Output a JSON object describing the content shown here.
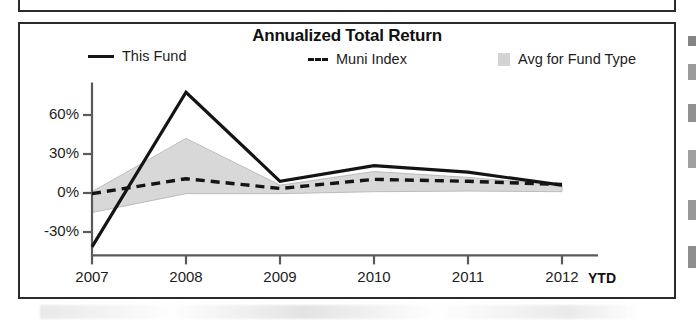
{
  "chart_data": {
    "type": "line",
    "title": "Annualized Total Return",
    "xlabel": "YTD",
    "ylabel": "",
    "categories": [
      "2007",
      "2008",
      "2009",
      "2010",
      "2011",
      "2012"
    ],
    "x_tick_labels": [
      "2007",
      "2008",
      "2009",
      "2010",
      "2011",
      "2012"
    ],
    "y_tick_labels": [
      "60%",
      "30%",
      "0%",
      "-30%"
    ],
    "y_ticks": [
      60,
      30,
      0,
      -30
    ],
    "ylim": [
      -48,
      85
    ],
    "grid": false,
    "legend_position": "top",
    "series": [
      {
        "name": "This Fund",
        "style": "solid-line",
        "values": [
          -41.5,
          77.5,
          9.0,
          21.0,
          16.0,
          6.0
        ]
      },
      {
        "name": "Muni Index",
        "style": "dashed-line",
        "values": [
          -0.5,
          11.0,
          3.5,
          10.5,
          9.0,
          6.5
        ]
      },
      {
        "name": "Avg for Fund Type",
        "style": "shaded-band",
        "band_upper": [
          1.0,
          42.0,
          6.0,
          16.5,
          12.0,
          6.0
        ],
        "band_lower": [
          -15.0,
          -0.5,
          -0.5,
          1.0,
          1.5,
          1.0
        ]
      }
    ],
    "colors": {
      "this_fund_line": "#141414",
      "muni_index_line": "#141414",
      "avg_band_fill": "#d8d8d8",
      "avg_band_stroke": "#b6b6b6",
      "axis": "#555555",
      "frame": "#2b2b2b",
      "text": "#1a1a1a"
    }
  },
  "chart": {
    "title": "Annualized Total Return",
    "x_axis_unit": "YTD",
    "legend": [
      {
        "label": "This Fund",
        "swatch": "solid-line-swatch"
      },
      {
        "label": "Muni Index",
        "swatch": "dashed-line-swatch"
      },
      {
        "label": "Avg for Fund Type",
        "swatch": "shaded-area-swatch"
      }
    ],
    "y_axis": {
      "labels": [
        "60%",
        "30%",
        "0%",
        "-30%"
      ]
    },
    "x_axis": {
      "labels": [
        "2007",
        "2008",
        "2009",
        "2010",
        "2011",
        "2012"
      ]
    }
  }
}
